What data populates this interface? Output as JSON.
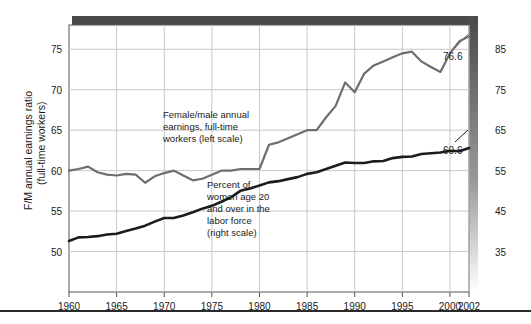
{
  "chart_data": {
    "type": "line",
    "title": "",
    "xlabel": "",
    "ylabel": "F/M annual earnings ratio\n(full-time workers)",
    "xlim": [
      1960,
      2002
    ],
    "left_axis": {
      "label": "F/M annual earnings ratio (full-time workers)",
      "ylim": [
        45,
        78
      ],
      "ticks": [
        50,
        55,
        60,
        65,
        70,
        75
      ],
      "tick_labels": [
        "50",
        "55",
        "60",
        "65",
        "70",
        "75"
      ]
    },
    "right_axis": {
      "label": "Percent of women age 20 and over in the labor force",
      "ylim": [
        25,
        91
      ],
      "ticks": [
        35,
        45,
        55,
        65,
        75,
        85
      ],
      "tick_labels": [
        "35",
        "45",
        "55",
        "65",
        "75",
        "85"
      ]
    },
    "x_ticks": [
      1960,
      1965,
      1970,
      1975,
      1980,
      1985,
      1990,
      1995,
      2000,
      2002
    ],
    "x_tick_labels": [
      "1960",
      "1965",
      "1970",
      "1975",
      "1980",
      "1985",
      "1990",
      "1995",
      "2000",
      "2002"
    ],
    "grid": true,
    "legend_position": "inline-annotations",
    "series": [
      {
        "name": "Female/male annual earnings, full-time workers (left scale)",
        "axis": "left",
        "color": "#6e6e6e",
        "x": [
          1960,
          1961,
          1962,
          1963,
          1964,
          1965,
          1966,
          1967,
          1968,
          1969,
          1970,
          1971,
          1972,
          1973,
          1974,
          1975,
          1976,
          1977,
          1978,
          1979,
          1980,
          1981,
          1982,
          1983,
          1984,
          1985,
          1986,
          1987,
          1988,
          1989,
          1990,
          1991,
          1992,
          1993,
          1994,
          1995,
          1996,
          1997,
          1998,
          1999,
          2000,
          2001,
          2002
        ],
        "values": [
          60.0,
          60.2,
          60.5,
          59.8,
          59.5,
          59.4,
          59.6,
          59.5,
          58.5,
          59.3,
          59.7,
          60.0,
          59.4,
          58.8,
          59.0,
          59.5,
          60.0,
          60.0,
          60.2,
          60.2,
          60.2,
          63.2,
          63.5,
          64.0,
          64.5,
          65.0,
          65.0,
          66.6,
          68.0,
          70.9,
          69.7,
          72.0,
          73.0,
          73.5,
          74.0,
          74.5,
          74.7,
          73.5,
          72.8,
          72.2,
          74.5,
          76.0,
          76.6
        ],
        "end_label": "76.6"
      },
      {
        "name": "Percent of women age 20 and over in the labor force (right scale)",
        "axis": "right",
        "color": "#1c1c1c",
        "x": [
          1960,
          1961,
          1962,
          1963,
          1964,
          1965,
          1966,
          1967,
          1968,
          1969,
          1970,
          1971,
          1972,
          1973,
          1974,
          1975,
          1976,
          1977,
          1978,
          1979,
          1980,
          1981,
          1982,
          1983,
          1984,
          1985,
          1986,
          1987,
          1988,
          1989,
          1990,
          1991,
          1992,
          1993,
          1994,
          1995,
          1996,
          1997,
          1998,
          1999,
          2000,
          2001,
          2002
        ],
        "values": [
          37.6,
          38.5,
          38.6,
          38.8,
          39.2,
          39.4,
          40.1,
          40.7,
          41.4,
          42.4,
          43.3,
          43.3,
          43.9,
          44.7,
          45.6,
          46.3,
          47.3,
          48.4,
          50.0,
          50.6,
          51.3,
          52.1,
          52.4,
          52.9,
          53.4,
          54.2,
          54.6,
          55.4,
          56.2,
          57.0,
          56.9,
          56.9,
          57.3,
          57.4,
          58.1,
          58.4,
          58.5,
          59.1,
          59.3,
          59.5,
          59.9,
          59.8,
          60.6
        ],
        "end_label": "60.6"
      }
    ],
    "annotations": [
      {
        "id": "gray-series-annotation",
        "lines": [
          "Female/male annual",
          "earnings, full-time",
          "workers (left scale)"
        ]
      },
      {
        "id": "black-series-annotation",
        "lines": [
          "Percent of",
          "women age 20",
          "and over in the",
          "labor force",
          "(right scale)"
        ]
      }
    ],
    "data_labels": [
      {
        "id": "gray-end-value",
        "text": "76.6"
      },
      {
        "id": "black-end-value",
        "text": "60.6"
      }
    ]
  },
  "axis_titles": {
    "left_line1": "F/M annual earnings ratio",
    "left_line2": "(full-time workers)"
  },
  "colors": {
    "gray_series": "#6e6e6e",
    "black_series": "#1c1c1c",
    "grid": "#c8c8c8",
    "frame": "#555555",
    "shadow": "#4a4a4a",
    "rule": "#2a2a2a"
  }
}
